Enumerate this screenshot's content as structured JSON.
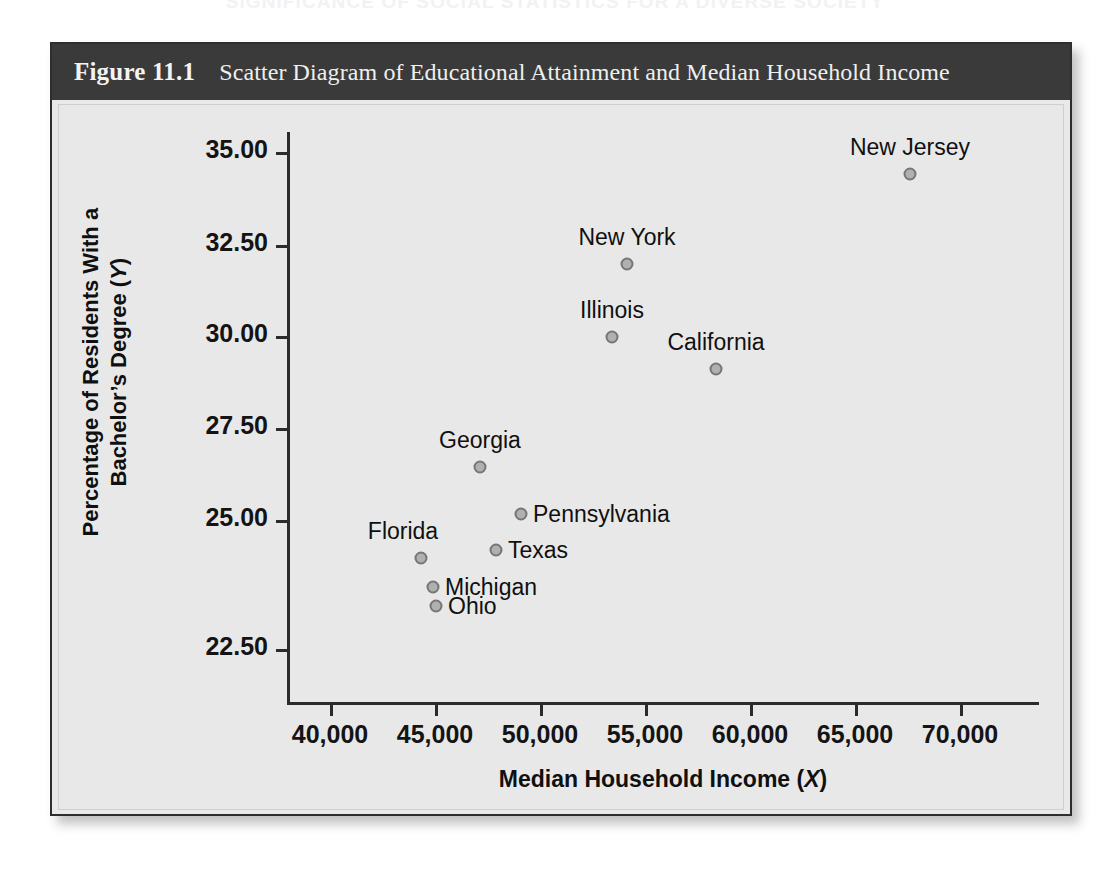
{
  "running_head": "SIGNIFICANCE OF SOCIAL STATISTICS FOR A DIVERSE SOCIETY",
  "figure": {
    "number_label": "Figure 11.1",
    "caption": "Scatter Diagram of Educational Attainment and Median Household Income"
  },
  "axes": {
    "y_title_line1": "Percentage of Residents With a",
    "y_title_line2": "Bachelor’s Degree (",
    "y_title_var": "Y",
    "y_title_close": ")",
    "x_title": "Median Household Income (",
    "x_title_var": "X",
    "x_title_close": ")",
    "y_ticks": [
      "35.00",
      "32.50",
      "30.00",
      "27.50",
      "25.00",
      "22.50"
    ],
    "x_ticks": [
      "40,000",
      "45,000",
      "50,000",
      "55,000",
      "60,000",
      "65,000",
      "70,000"
    ]
  },
  "colors": {
    "header_bar": "#3a3a3a",
    "panel_background": "#e8e8e8",
    "figure_border": "#2e2e2e",
    "marker_fill": "#b0b0b0",
    "marker_stroke": "#767676",
    "axis": "#2b2b2b",
    "text": "#101010"
  },
  "chart_data": {
    "type": "scatter",
    "title": "Scatter Diagram of Educational Attainment and Median Household Income",
    "xlabel": "Median Household Income (X)",
    "ylabel": "Percentage of Residents With a Bachelor's Degree (Y)",
    "xlim": [
      38000,
      71500
    ],
    "ylim": [
      21.9,
      35.9
    ],
    "xticks": [
      40000,
      45000,
      50000,
      55000,
      60000,
      65000,
      70000
    ],
    "yticks": [
      35.0,
      32.5,
      30.0,
      27.5,
      25.0,
      22.5
    ],
    "grid": false,
    "legend": "none",
    "point_label_position": "per-point",
    "points": [
      {
        "label": "New Jersey",
        "x": 68000,
        "y": 34.6,
        "px": 908,
        "py": 172,
        "label_pos": "above"
      },
      {
        "label": "New York",
        "x": 54500,
        "y": 32.4,
        "px": 625,
        "py": 262,
        "label_pos": "above"
      },
      {
        "label": "Illinois",
        "x": 53800,
        "y": 30.6,
        "px": 610,
        "py": 335,
        "label_pos": "above"
      },
      {
        "label": "California",
        "x": 58800,
        "y": 29.9,
        "px": 714,
        "py": 367,
        "label_pos": "above"
      },
      {
        "label": "Georgia",
        "x": 47500,
        "y": 27.5,
        "px": 478,
        "py": 465,
        "label_pos": "above"
      },
      {
        "label": "Pennsylvania",
        "x": 49500,
        "y": 26.3,
        "px": 519,
        "py": 512,
        "label_pos": "right"
      },
      {
        "label": "Texas",
        "x": 48300,
        "y": 25.5,
        "px": 494,
        "py": 548,
        "label_pos": "right"
      },
      {
        "label": "Florida",
        "x": 44700,
        "y": 25.3,
        "px": 419,
        "py": 556,
        "label_pos": "above"
      },
      {
        "label": "Michigan",
        "x": 45300,
        "y": 24.6,
        "px": 431,
        "py": 585,
        "label_pos": "right"
      },
      {
        "label": "Ohio",
        "x": 45400,
        "y": 24.1,
        "px": 434,
        "py": 604,
        "label_pos": "right"
      }
    ]
  }
}
